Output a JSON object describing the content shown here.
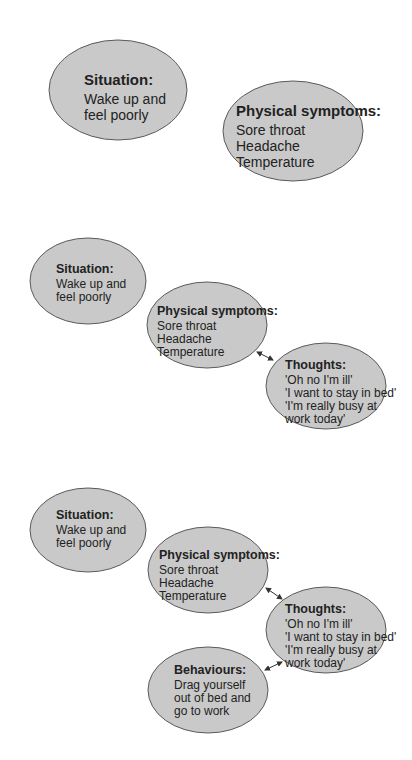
{
  "colors": {
    "ellipse_fill": "#c9c9c9",
    "ellipse_stroke": "#5a5a5a",
    "arrow": "#333333",
    "text": "#222222"
  },
  "diagrams": [
    {
      "nodes": [
        {
          "id": "situation",
          "title": "Situation:",
          "lines": [
            "Wake up and",
            "feel poorly"
          ]
        },
        {
          "id": "physical",
          "title": "Physical symptoms:",
          "lines": [
            "Sore throat",
            "Headache",
            "Temperature"
          ]
        }
      ]
    },
    {
      "nodes": [
        {
          "id": "situation",
          "title": "Situation:",
          "lines": [
            "Wake up and",
            "feel poorly"
          ]
        },
        {
          "id": "physical",
          "title": "Physical symptoms:",
          "lines": [
            "Sore throat",
            "Headache",
            "Temperature"
          ]
        },
        {
          "id": "thoughts",
          "title": "Thoughts:",
          "lines": [
            "'Oh no I'm ill'",
            "'I want to stay in bed'",
            "'I'm really busy at",
            "work today'"
          ]
        }
      ],
      "edges": [
        {
          "from": "physical",
          "to": "thoughts",
          "type": "bidirectional"
        }
      ]
    },
    {
      "nodes": [
        {
          "id": "situation",
          "title": "Situation:",
          "lines": [
            "Wake up and",
            "feel poorly"
          ]
        },
        {
          "id": "physical",
          "title": "Physical symptoms:",
          "lines": [
            "Sore throat",
            "Headache",
            "Temperature"
          ]
        },
        {
          "id": "thoughts",
          "title": "Thoughts:",
          "lines": [
            "'Oh no I'm ill'",
            "'I want to stay in bed'",
            "'I'm really busy at",
            "work today'"
          ]
        },
        {
          "id": "behaviours",
          "title": "Behaviours:",
          "lines": [
            "Drag yourself",
            "out of bed and",
            "go to work"
          ]
        }
      ],
      "edges": [
        {
          "from": "physical",
          "to": "thoughts",
          "type": "bidirectional"
        },
        {
          "from": "thoughts",
          "to": "behaviours",
          "type": "bidirectional"
        }
      ]
    }
  ]
}
